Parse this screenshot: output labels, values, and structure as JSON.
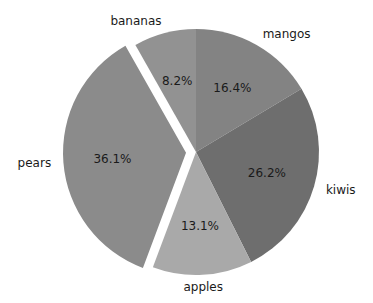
{
  "chart_data": {
    "type": "pie",
    "title": "",
    "categories": [
      "mangos",
      "kiwis",
      "apples",
      "pears",
      "bananas"
    ],
    "values": [
      16.4,
      26.2,
      13.1,
      36.1,
      8.2
    ],
    "percent_labels": [
      "16.4%",
      "26.2%",
      "13.1%",
      "36.1%",
      "8.2%"
    ],
    "colors": [
      "#838383",
      "#6e6e6e",
      "#a9a9a9",
      "#8b8b8b",
      "#929292"
    ],
    "explode": [
      0,
      0,
      0,
      0.08,
      0
    ],
    "start_angle_deg": 90,
    "direction": "clockwise",
    "legend": false
  },
  "geometry": {
    "cx": 196,
    "cy": 152,
    "r": 123,
    "explode_px": 10
  }
}
